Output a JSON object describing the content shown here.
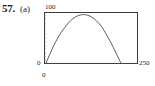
{
  "figure": {
    "problem_number": "57.",
    "part_label": "(a)"
  },
  "chart_data": {
    "type": "line",
    "title": "",
    "xlabel": "",
    "ylabel": "",
    "xlim": [
      0,
      250
    ],
    "ylim": [
      0,
      100
    ],
    "grid": false,
    "legend": null,
    "axis_tick_labels": {
      "y_max": "100",
      "y_min": "0",
      "x_min": "0",
      "x_max": "250"
    },
    "minor_ticks": {
      "x_count": 24,
      "y_count": 14
    },
    "series": [
      {
        "name": "projectile path",
        "x": [
          5,
          15,
          25,
          35,
          45,
          55,
          65,
          75,
          85,
          95,
          105,
          115,
          125,
          135,
          145,
          155,
          165,
          175,
          185,
          195,
          205
        ],
        "y": [
          1,
          18,
          34,
          48,
          60,
          70,
          79,
          86,
          91,
          94,
          95,
          94,
          91,
          86,
          79,
          70,
          58,
          45,
          31,
          16,
          1
        ]
      }
    ]
  }
}
